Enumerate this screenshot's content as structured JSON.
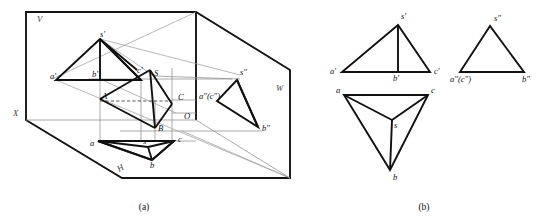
{
  "figure": {
    "captions": [
      {
        "key": "a",
        "text": "(a)"
      },
      {
        "key": "b",
        "text": "(b)"
      }
    ],
    "colors": {
      "line_heavy": "#111111",
      "line_thin": "#8d8d8d",
      "line_dashed": "#2b2b2b",
      "projection_ray": "#9a9a9a",
      "background": "#ffffff",
      "label": "#111111"
    }
  },
  "part_a": {
    "name": "pictorial-three-plane-view",
    "plane_labels": [
      {
        "name": "v-plane-label",
        "text": "V",
        "x": 37,
        "y": 22
      },
      {
        "name": "w-plane-label",
        "text": "W",
        "x": 276,
        "y": 91
      },
      {
        "name": "h-plane-label",
        "text": "H",
        "x": 119,
        "y": 172
      },
      {
        "name": "x-axis-label",
        "text": "X",
        "x": 13,
        "y": 116
      },
      {
        "name": "origin-label",
        "text": "O",
        "x": 184,
        "y": 119
      }
    ],
    "space_points": [
      {
        "name": "point-S",
        "text": "S",
        "x": 154,
        "y": 76
      },
      {
        "name": "point-A",
        "text": "A",
        "x": 102,
        "y": 99
      },
      {
        "name": "point-B",
        "text": "B",
        "x": 158,
        "y": 131
      },
      {
        "name": "point-C",
        "text": "C",
        "x": 178,
        "y": 100
      }
    ],
    "frontal_projection_labels": [
      {
        "name": "label-s-prime",
        "text": "s'",
        "x": 100,
        "y": 37
      },
      {
        "name": "label-a-prime",
        "text": "a'",
        "x": 50,
        "y": 79
      },
      {
        "name": "label-b-prime",
        "text": "b'",
        "x": 92,
        "y": 77
      },
      {
        "name": "label-c-prime",
        "text": "c'",
        "x": 138,
        "y": 73
      }
    ],
    "horizontal_projection_labels": [
      {
        "name": "label-a",
        "text": "a",
        "x": 90,
        "y": 146
      },
      {
        "name": "label-b",
        "text": "b",
        "x": 142,
        "y": 166
      },
      {
        "name": "label-c",
        "text": "c",
        "x": 180,
        "y": 143
      },
      {
        "name": "label-s",
        "text": "s",
        "x": 143,
        "y": 144
      }
    ],
    "profile_projection_labels": [
      {
        "name": "label-s-dblprime",
        "text": "s\"",
        "x": 240,
        "y": 75
      },
      {
        "name": "label-ac-dblprime",
        "text": "a\"(c\")",
        "x": 199,
        "y": 99
      },
      {
        "name": "label-b-dblprime",
        "text": "b\"",
        "x": 264,
        "y": 129
      }
    ]
  },
  "part_b": {
    "name": "orthographic-three-view-drawing",
    "frontal_view": {
      "name": "frontal-view-v",
      "labels": [
        {
          "name": "label-s-prime",
          "text": "s'",
          "x": 400,
          "y": 18
        },
        {
          "name": "label-a-prime",
          "text": "a'",
          "x": 330,
          "y": 71
        },
        {
          "name": "label-b-prime",
          "text": "b'",
          "x": 391,
          "y": 78
        },
        {
          "name": "label-c-prime",
          "text": "c'",
          "x": 435,
          "y": 71
        }
      ]
    },
    "profile_view": {
      "name": "profile-view-w",
      "labels": [
        {
          "name": "label-s-dblprime",
          "text": "s\"",
          "x": 495,
          "y": 19
        },
        {
          "name": "label-ac-dblprime",
          "text": "a\"(c\")",
          "x": 455,
          "y": 79
        },
        {
          "name": "label-b-dblprime",
          "text": "b\"",
          "x": 525,
          "y": 78
        }
      ]
    },
    "horizontal_view": {
      "name": "horizontal-view-h",
      "labels": [
        {
          "name": "label-a",
          "text": "a",
          "x": 336,
          "y": 92
        },
        {
          "name": "label-c",
          "text": "c",
          "x": 433,
          "y": 92
        },
        {
          "name": "label-s",
          "text": "s",
          "x": 394,
          "y": 124
        },
        {
          "name": "label-b",
          "text": "b",
          "x": 395,
          "y": 175
        }
      ]
    }
  }
}
